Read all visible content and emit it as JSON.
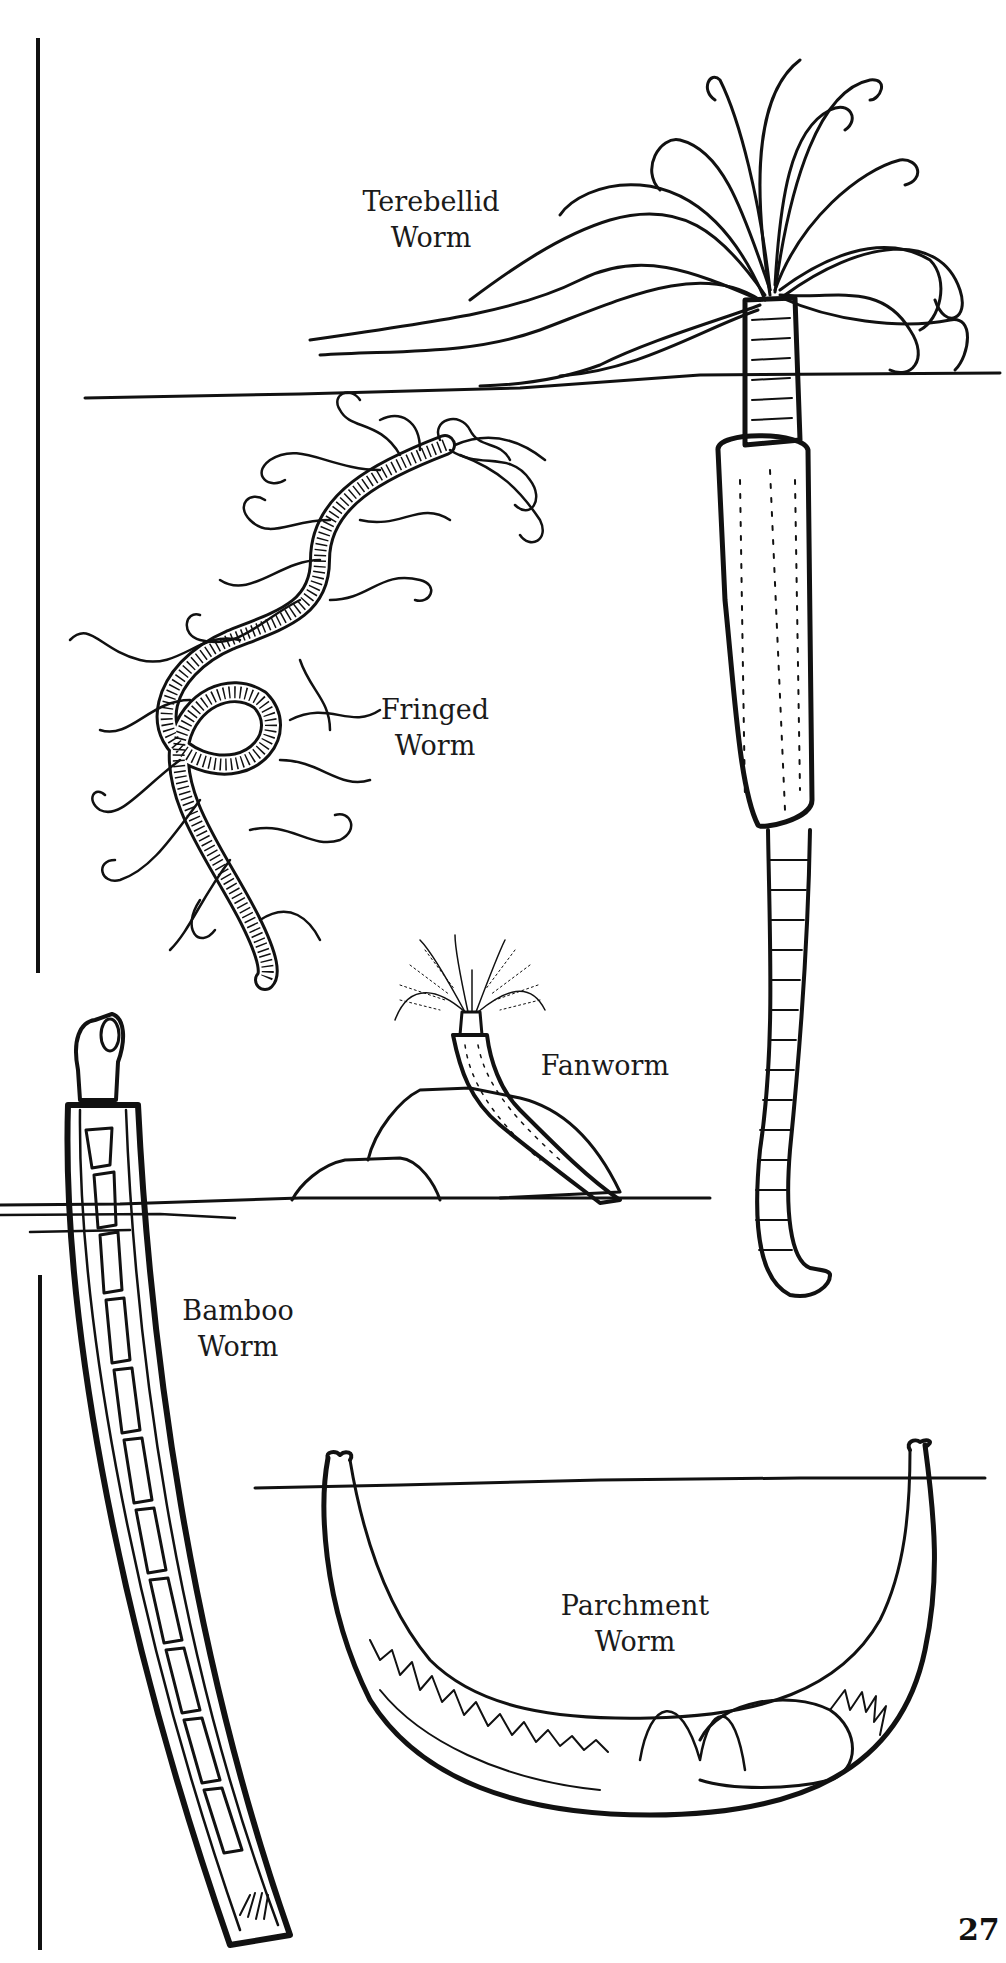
{
  "page": {
    "type": "coloring-book illustration page",
    "page_number": "27",
    "ink_color": "#111111",
    "background": "#ffffff"
  },
  "labels": {
    "terebellid": {
      "line1": "Terebellid",
      "line2": "Worm"
    },
    "fringed": {
      "line1": "Fringed",
      "line2": "Worm"
    },
    "fanworm": {
      "line1": "Fanworm"
    },
    "bamboo": {
      "line1": "Bamboo",
      "line2": "Worm"
    },
    "parchment": {
      "line1": "Parchment",
      "line2": "Worm"
    }
  },
  "illustrations": [
    {
      "id": "terebellid-worm",
      "description": "tube worm with long tentacles above seabed, long tube extending below"
    },
    {
      "id": "fringed-worm",
      "description": "coiled segmented worm with wavy fringe filaments"
    },
    {
      "id": "fanworm",
      "description": "feather-duster worm emerging from rocks on seabed"
    },
    {
      "id": "bamboo-worm",
      "description": "long segmented worm inside a slanted tube"
    },
    {
      "id": "parchment-worm",
      "description": "worm inside a U-shaped burrow below seabed line"
    }
  ]
}
